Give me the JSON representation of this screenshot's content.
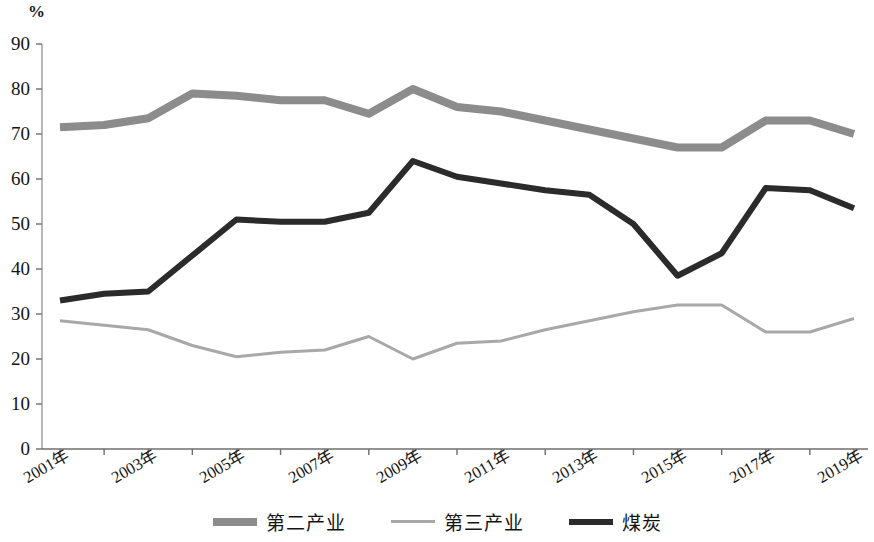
{
  "axis": {
    "unit_label": "%",
    "y_ticks": [
      "0",
      "10",
      "20",
      "30",
      "40",
      "50",
      "60",
      "70",
      "80",
      "90"
    ],
    "x_ticks": [
      "2001年",
      "2003年",
      "2005年",
      "2007年",
      "2009年",
      "2011年",
      "2013年",
      "2015年",
      "2017年",
      "2019年"
    ]
  },
  "legend": {
    "items": [
      {
        "label": "第二产业",
        "color": "#8c8c8c",
        "width": 8
      },
      {
        "label": "第三产业",
        "color": "#a8a8a8",
        "width": 3
      },
      {
        "label": "煤炭",
        "color": "#2b2b2b",
        "width": 6
      }
    ]
  },
  "chart_data": {
    "type": "line",
    "title": "",
    "xlabel": "",
    "ylabel": "%",
    "ylim": [
      0,
      90
    ],
    "ytick_step": 10,
    "grid": false,
    "legend_position": "bottom",
    "x": [
      "2001年",
      "2002年",
      "2003年",
      "2004年",
      "2005年",
      "2006年",
      "2007年",
      "2008年",
      "2009年",
      "2010年",
      "2011年",
      "2012年",
      "2013年",
      "2014年",
      "2015年",
      "2016年",
      "2017年",
      "2018年",
      "2019年"
    ],
    "x_tick_labels": [
      "2001年",
      "2003年",
      "2005年",
      "2007年",
      "2009年",
      "2011年",
      "2013年",
      "2015年",
      "2017年",
      "2019年"
    ],
    "series": [
      {
        "name": "第二产业",
        "color": "#8c8c8c",
        "line_width": 8,
        "values": [
          71.5,
          72.0,
          73.5,
          79.0,
          78.5,
          77.5,
          77.5,
          74.5,
          80.0,
          76.0,
          75.0,
          73.0,
          71.0,
          69.0,
          67.0,
          67.0,
          73.0,
          73.0,
          70.0
        ]
      },
      {
        "name": "第三产业",
        "color": "#a8a8a8",
        "line_width": 3,
        "values": [
          28.5,
          27.5,
          26.5,
          23.0,
          20.5,
          21.5,
          22.0,
          25.0,
          20.0,
          23.5,
          24.0,
          26.5,
          28.5,
          30.5,
          32.0,
          32.0,
          26.0,
          26.0,
          29.0
        ]
      },
      {
        "name": "煤炭",
        "color": "#2b2b2b",
        "line_width": 6,
        "values": [
          33.0,
          34.5,
          35.0,
          43.0,
          51.0,
          50.5,
          50.5,
          52.5,
          64.0,
          60.5,
          59.0,
          57.5,
          56.5,
          50.0,
          38.5,
          43.5,
          58.0,
          57.5,
          53.5
        ]
      }
    ]
  }
}
